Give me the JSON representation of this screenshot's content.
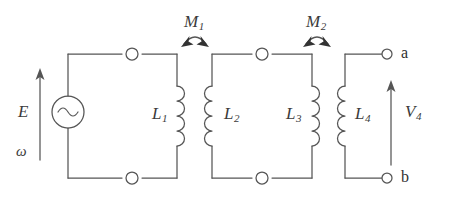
{
  "diagram": {
    "type": "electrical-schematic",
    "stroke_color": "#555555",
    "text_color": "#3b3b3b",
    "background_color": "#ffffff"
  },
  "source": {
    "symbol": "sine-wave",
    "emf_label": "E",
    "frequency_label": "ω",
    "arrow_direction": "up"
  },
  "inductors": [
    {
      "name": "L",
      "subscript": "1",
      "bumps": 4,
      "bulge": "right"
    },
    {
      "name": "L",
      "subscript": "2",
      "bumps": 4,
      "bulge": "left"
    },
    {
      "name": "L",
      "subscript": "3",
      "bumps": 4,
      "bulge": "right"
    },
    {
      "name": "L",
      "subscript": "4",
      "bumps": 4,
      "bulge": "left"
    }
  ],
  "couplings": [
    {
      "name": "M",
      "subscript": "1",
      "between": [
        "L1",
        "L2"
      ],
      "arrow": "double-headed-curved"
    },
    {
      "name": "M",
      "subscript": "2",
      "between": [
        "L3",
        "L4"
      ],
      "arrow": "double-headed-curved"
    }
  ],
  "terminals": [
    {
      "label": "a",
      "position": "top-right",
      "marker": "open-circle"
    },
    {
      "label": "b",
      "position": "bottom-right",
      "marker": "open-circle"
    }
  ],
  "output": {
    "voltage_label": "V",
    "voltage_subscript": "4",
    "arrow_direction": "up"
  },
  "nodes": [
    {
      "name": "node-top-left",
      "marker": "open-circle"
    },
    {
      "name": "node-top-middle",
      "marker": "open-circle"
    },
    {
      "name": "node-bottom-left",
      "marker": "open-circle"
    },
    {
      "name": "node-bottom-middle",
      "marker": "open-circle"
    }
  ]
}
